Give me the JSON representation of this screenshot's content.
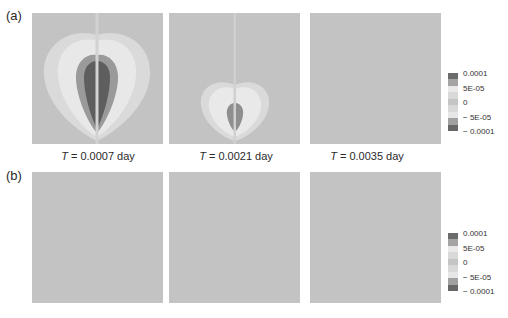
{
  "chart_data": {
    "type": "heatmap",
    "title": "",
    "rows": [
      {
        "label": "(a)",
        "panels": [
          {
            "caption_var": "T",
            "caption_rest": " = 0.0007 day",
            "pattern": "strong"
          },
          {
            "caption_var": "T",
            "caption_rest": " = 0.0021 day",
            "pattern": "weak"
          },
          {
            "caption_var": "T",
            "caption_rest": " = 0.0035 day",
            "pattern": "none"
          }
        ]
      },
      {
        "label": "(b)",
        "panels": [
          {
            "pattern": "none"
          },
          {
            "pattern": "none"
          },
          {
            "pattern": "none"
          }
        ]
      }
    ],
    "colorbar": {
      "ticks": [
        "0.0001",
        "5E-05",
        "0",
        "− 5E-05",
        "− 0.0001"
      ],
      "range": [
        -0.0001,
        0.0001
      ],
      "levels": [
        {
          "value": 0.0001,
          "color": "#6b6b6b"
        },
        {
          "value": 7.5e-05,
          "color": "#a4a4a4"
        },
        {
          "value": 5e-05,
          "color": "#e9e9e9"
        },
        {
          "value": 2.5e-05,
          "color": "#d8d8d8"
        },
        {
          "value": 0,
          "color": "#c4c4c4"
        },
        {
          "value": -2.5e-05,
          "color": "#d8d8d8"
        },
        {
          "value": -5e-05,
          "color": "#e6e6e6"
        },
        {
          "value": -7.5e-05,
          "color": "#a0a0a0"
        },
        {
          "value": -0.0001,
          "color": "#676767"
        }
      ]
    }
  }
}
